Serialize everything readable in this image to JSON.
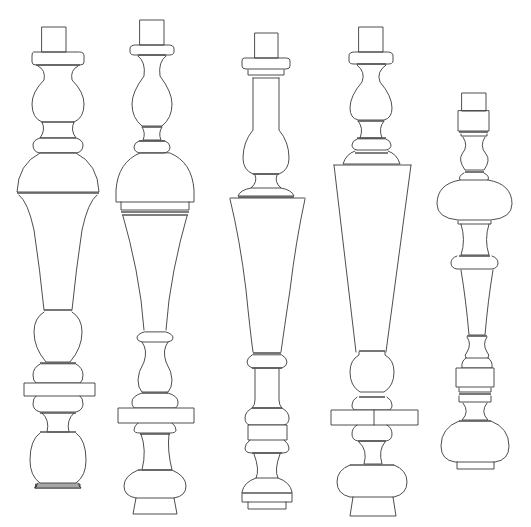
{
  "figure": {
    "description": "Line drawing of five turned baluster designs",
    "background": "#ffffff",
    "line_color": "#3a3a3a"
  },
  "balusters": [
    {
      "id": "baluster-1",
      "cx": 58,
      "shapes": [
        {
          "t": "rect",
          "x": 42,
          "y": 27,
          "w": 24,
          "h": 25
        },
        {
          "t": "path",
          "d": "M33 52 Q32 52 32 56 L32 62 Q32 65 36 65 L80 65 Q84 65 84 62 L84 56 Q84 52 80 52 Z"
        },
        {
          "t": "line",
          "x1": 36,
          "y1": 65,
          "x2": 80,
          "y2": 65,
          "c": "thick"
        },
        {
          "t": "path",
          "d": "M38 66 Q46 70 44 80 Q32 92 32 104 Q32 118 42 122 L74 122 Q84 118 84 104 Q84 92 72 80 Q70 70 78 66"
        },
        {
          "t": "line",
          "x1": 42,
          "y1": 122,
          "x2": 74,
          "y2": 122
        },
        {
          "t": "path",
          "d": "M42 122 Q46 130 40 138 L76 138 Q70 130 74 122"
        },
        {
          "t": "path",
          "d": "M40 138 Q33 140 33 145 Q33 152 40 153 L76 153 Q83 152 83 145 Q83 140 76 138 Z"
        },
        {
          "t": "path",
          "d": "M40 153 Q18 164 17 192 L99 192 Q98 164 76 153 Z"
        },
        {
          "t": "line",
          "x1": 17,
          "y1": 193,
          "x2": 99,
          "y2": 193,
          "c": "thick"
        },
        {
          "t": "path",
          "d": "M19 195 Q28 202 34 230 Q40 270 44 310"
        },
        {
          "t": "path",
          "d": "M97 195 Q88 202 82 230 Q76 270 72 310"
        },
        {
          "t": "line",
          "x1": 44,
          "y1": 310,
          "x2": 72,
          "y2": 310,
          "c": "thick"
        },
        {
          "t": "path",
          "d": "M44 312 Q34 318 34 332 Q34 348 46 362 L70 362 Q82 348 82 332 Q82 318 72 312"
        },
        {
          "t": "path",
          "d": "M40 364 Q33 368 33 375 Q33 381 36 383 L80 383 Q83 381 83 375 Q83 368 76 364 Z"
        },
        {
          "t": "line",
          "x1": 40,
          "y1": 363,
          "x2": 76,
          "y2": 363,
          "c": "thick"
        },
        {
          "t": "rect",
          "x": 24,
          "y": 383,
          "w": 71,
          "h": 13,
          "f": true
        },
        {
          "t": "path",
          "d": "M36 396 Q33 398 33 404 Q33 410 40 412 L76 412 Q83 410 83 404 Q83 398 80 396"
        },
        {
          "t": "line",
          "x1": 40,
          "y1": 413,
          "x2": 76,
          "y2": 413,
          "c": "thick"
        },
        {
          "t": "path",
          "d": "M42 413 Q50 420 47 432 L69 432 Q66 420 74 413"
        },
        {
          "t": "line",
          "x1": 40,
          "y1": 432,
          "x2": 76,
          "y2": 432,
          "c": "thick"
        },
        {
          "t": "path",
          "d": "M40 433 Q30 440 30 460 Q30 476 40 483 L76 483 Q86 476 86 460 Q86 440 76 433"
        },
        {
          "t": "path",
          "d": "M38 483 L35 488 L35 488 L81 488 L78 483"
        },
        {
          "t": "path",
          "d": "M35 488 L35 488 L35 487"
        },
        {
          "t": "path",
          "d": "M36 485 L35 488"
        },
        {
          "t": "rect",
          "x": 36,
          "y": 484,
          "w": 44,
          "h": 2,
          "nf": true
        },
        {
          "t": "path",
          "d": "M37 486 L35 488 L81 488 L79 486"
        }
      ]
    },
    {
      "id": "baluster-2",
      "cx": 153,
      "shapes": [
        {
          "t": "rect",
          "x": 140,
          "y": 20,
          "w": 24,
          "h": 25
        },
        {
          "t": "path",
          "d": "M135 45 Q130 45 130 49 L130 52 Q130 55 135 55 L169 55 Q174 55 174 52 L174 49 Q174 45 169 45 Z"
        },
        {
          "t": "line",
          "x1": 138,
          "y1": 55,
          "x2": 166,
          "y2": 55,
          "c": "thick"
        },
        {
          "t": "path",
          "d": "M138 56 Q146 62 144 76 Q132 92 132 104 Q132 118 142 126 L162 126 Q172 118 172 104 Q172 92 160 76 Q158 62 166 56"
        },
        {
          "t": "path",
          "d": "M142 127 Q146 133 143 140 L161 140 Q158 133 162 127"
        },
        {
          "t": "line",
          "x1": 142,
          "y1": 127,
          "x2": 162,
          "y2": 127,
          "c": "thick"
        },
        {
          "t": "path",
          "d": "M139 141 Q134 143 134 147 Q134 152 140 153 L164 153 Q170 152 170 147 Q170 143 165 141 Z"
        },
        {
          "t": "line",
          "x1": 139,
          "y1": 141,
          "x2": 165,
          "y2": 141,
          "c": "thick"
        },
        {
          "t": "path",
          "d": "M140 153 Q118 162 116 190 Q116 196 116 202 L194 202 Q194 196 194 190 Q192 162 170 153 Z"
        },
        {
          "t": "path",
          "d": "M121 202 L121 210 L189 210 L189 202"
        },
        {
          "t": "line",
          "x1": 121,
          "y1": 212,
          "x2": 189,
          "y2": 212,
          "c": "thick"
        },
        {
          "t": "line",
          "x1": 122,
          "y1": 215,
          "x2": 188,
          "y2": 215,
          "c": "thick"
        },
        {
          "t": "path",
          "d": "M123 216 Q130 240 136 270 Q142 300 144 330"
        },
        {
          "t": "path",
          "d": "M187 216 Q180 240 174 270 Q168 300 166 330"
        },
        {
          "t": "path",
          "d": "M144 332 Q137 334 137 338 Q137 341 142 342 L168 342 Q173 341 173 338 Q173 334 166 332 Z"
        },
        {
          "t": "path",
          "d": "M142 342 Q148 350 144 362 Q138 372 138 380 Q138 388 142 392 L168 392 Q172 388 172 380 Q172 372 166 362 Q162 350 168 342"
        },
        {
          "t": "line",
          "x1": 142,
          "y1": 393,
          "x2": 168,
          "y2": 393,
          "c": "thick"
        },
        {
          "t": "path",
          "d": "M142 393 Q132 396 132 402 Q132 408 136 408 L174 408 Q178 408 178 402 Q178 396 168 393"
        },
        {
          "t": "rect",
          "x": 118,
          "y": 408,
          "w": 76,
          "h": 15,
          "f": true
        },
        {
          "t": "path",
          "d": "M138 423 Q134 426 134 430 Q134 433 140 433 L170 433 Q176 433 176 430 Q176 426 172 423"
        },
        {
          "t": "line",
          "x1": 140,
          "y1": 434,
          "x2": 170,
          "y2": 434,
          "c": "thick"
        },
        {
          "t": "path",
          "d": "M141 434 Q147 450 142 470 L172 470 Q167 450 169 434"
        },
        {
          "t": "line",
          "x1": 138,
          "y1": 470,
          "x2": 172,
          "y2": 470,
          "c": "thick"
        },
        {
          "t": "path",
          "d": "M138 470 Q124 476 124 486 Q124 496 136 498 L174 498 Q186 496 186 486 Q186 476 172 470"
        },
        {
          "t": "path",
          "d": "M136 498 L133 514 L177 514 L174 498"
        }
      ]
    },
    {
      "id": "baluster-3",
      "cx": 266,
      "shapes": [
        {
          "t": "rect",
          "x": 255,
          "y": 33,
          "w": 23,
          "h": 25
        },
        {
          "t": "path",
          "d": "M244 58 Q242 58 242 61 L242 66 Q242 69 246 69 L286 69 Q290 69 290 66 L290 61 Q290 58 287 58 Z"
        },
        {
          "t": "path",
          "d": "M248 70 L248 75 L284 75 L284 70"
        },
        {
          "t": "line",
          "x1": 253,
          "y1": 78,
          "x2": 279,
          "y2": 78
        },
        {
          "t": "path",
          "d": "M253 78 L253 130 Q243 142 243 158 Q243 170 253 174 L279 174 Q289 170 289 158 Q289 142 279 130 L279 78"
        },
        {
          "t": "line",
          "x1": 253,
          "y1": 174,
          "x2": 279,
          "y2": 174,
          "c": "thick"
        },
        {
          "t": "path",
          "d": "M255 175 Q258 182 251 188 L281 188 Q274 182 277 175"
        },
        {
          "t": "path",
          "d": "M251 188 Q240 190 238 196 L294 196 Q292 190 281 188"
        },
        {
          "t": "line",
          "x1": 238,
          "y1": 197,
          "x2": 294,
          "y2": 197,
          "c": "thick"
        },
        {
          "t": "path",
          "d": "M230 198 L305 198"
        },
        {
          "t": "path",
          "d": "M230 199 Q240 240 246 290 Q250 330 253 352"
        },
        {
          "t": "path",
          "d": "M305 199 Q296 240 290 290 Q284 330 281 352"
        },
        {
          "t": "line",
          "x1": 253,
          "y1": 353,
          "x2": 281,
          "y2": 353,
          "c": "thick"
        },
        {
          "t": "path",
          "d": "M252 355 Q247 358 247 362 Q247 366 252 368 L282 368 Q287 366 287 362 Q287 358 282 355 Z"
        },
        {
          "t": "line",
          "x1": 252,
          "y1": 368,
          "x2": 282,
          "y2": 368,
          "c": "thick"
        },
        {
          "t": "path",
          "d": "M255 369 L255 400 Q255 405 252 408 L282 408 Q279 405 279 400 L279 369"
        },
        {
          "t": "path",
          "d": "M252 408 Q245 412 245 418 Q245 424 250 425 L284 425 Q289 424 289 418 Q289 412 282 408"
        },
        {
          "t": "line",
          "x1": 252,
          "y1": 408,
          "x2": 282,
          "y2": 408,
          "c": "thick"
        },
        {
          "t": "rect",
          "x": 248,
          "y": 425,
          "w": 39,
          "h": 15,
          "f": true
        },
        {
          "t": "path",
          "d": "M250 440 Q245 444 245 448 Q245 453 252 453 L282 453 Q289 453 289 448 Q289 444 284 440"
        },
        {
          "t": "line",
          "x1": 252,
          "y1": 453,
          "x2": 282,
          "y2": 453,
          "c": "thick"
        },
        {
          "t": "path",
          "d": "M254 454 Q260 470 256 478 L278 478 Q274 470 280 454"
        },
        {
          "t": "path",
          "d": "M256 478 Q244 482 242 492 L242 502 L292 502 L292 492 Q290 482 278 478"
        },
        {
          "t": "line",
          "x1": 242,
          "y1": 493,
          "x2": 292,
          "y2": 493,
          "c": "thick"
        },
        {
          "t": "path",
          "d": "M248 502 L248 509 L286 509 L286 502"
        }
      ]
    },
    {
      "id": "baluster-4",
      "cx": 373,
      "shapes": [
        {
          "t": "rect",
          "x": 359,
          "y": 27,
          "w": 24,
          "h": 25
        },
        {
          "t": "path",
          "d": "M354 52 Q349 52 349 56 L349 61 Q349 64 354 64 L388 64 Q393 64 393 61 L393 56 Q393 52 388 52 Z"
        },
        {
          "t": "line",
          "x1": 357,
          "y1": 64,
          "x2": 386,
          "y2": 64,
          "c": "thick"
        },
        {
          "t": "path",
          "d": "M357 65 Q366 72 362 82 Q350 96 350 108 Q350 118 358 120 L384 120 Q392 118 392 108 Q392 96 380 82 Q376 72 386 65"
        },
        {
          "t": "path",
          "d": "M358 121 Q364 128 360 138 L382 138 Q378 128 384 121"
        },
        {
          "t": "line",
          "x1": 358,
          "y1": 121,
          "x2": 384,
          "y2": 121,
          "c": "thick"
        },
        {
          "t": "path",
          "d": "M357 139 Q352 141 352 145 Q352 149 357 150 L386 150 Q391 149 391 145 Q391 141 386 139 Z"
        },
        {
          "t": "line",
          "x1": 357,
          "y1": 138,
          "x2": 386,
          "y2": 138,
          "c": "thick"
        },
        {
          "t": "line",
          "x1": 355,
          "y1": 153,
          "x2": 388,
          "y2": 153,
          "c": "thick"
        },
        {
          "t": "path",
          "d": "M355 151 Q346 154 343 164 L400 164 Q397 154 388 151"
        },
        {
          "t": "path",
          "d": "M334 165 L411 165"
        },
        {
          "t": "path",
          "d": "M334 165 L356 352"
        },
        {
          "t": "path",
          "d": "M411 165 L386 352"
        },
        {
          "t": "line",
          "x1": 359,
          "y1": 351,
          "x2": 385,
          "y2": 351,
          "c": "thick"
        },
        {
          "t": "path",
          "d": "M359 352 L359 355 Q350 360 350 372 Q350 386 360 392 L384 392 Q394 386 394 372 Q394 360 385 355 L385 352"
        },
        {
          "t": "line",
          "x1": 359,
          "y1": 397,
          "x2": 385,
          "y2": 397,
          "c": "thick"
        },
        {
          "t": "path",
          "d": "M357 397 Q352 400 352 405 Q352 410 356 410 L388 410 Q392 410 392 405 Q392 400 387 397"
        },
        {
          "t": "rect",
          "x": 331,
          "y": 410,
          "w": 87,
          "h": 15,
          "f": true
        },
        {
          "t": "line",
          "x1": 374,
          "y1": 410,
          "x2": 374,
          "y2": 425
        },
        {
          "t": "path",
          "d": "M357 425 Q352 428 352 434 Q352 440 358 441 L386 441 Q392 440 392 434 Q392 428 387 425"
        },
        {
          "t": "line",
          "x1": 358,
          "y1": 441,
          "x2": 386,
          "y2": 441,
          "c": "thick"
        },
        {
          "t": "path",
          "d": "M359 442 Q368 450 364 464 L382 464 Q378 450 385 442"
        },
        {
          "t": "line",
          "x1": 350,
          "y1": 465,
          "x2": 394,
          "y2": 465,
          "c": "thick"
        },
        {
          "t": "path",
          "d": "M350 465 Q337 470 337 482 Q337 494 350 497 L394 497 Q407 494 407 482 Q407 470 394 465"
        },
        {
          "t": "path",
          "d": "M353 497 L350 516 L396 516 L393 497"
        }
      ]
    },
    {
      "id": "baluster-5",
      "cx": 482,
      "shapes": [
        {
          "t": "rect",
          "x": 462,
          "y": 93,
          "w": 24,
          "h": 18
        },
        {
          "t": "path",
          "d": "M458 111 L458 131 L489 131 L489 111 Z"
        },
        {
          "t": "line",
          "x1": 459,
          "y1": 132,
          "x2": 488,
          "y2": 132,
          "c": "thick"
        },
        {
          "t": "path",
          "d": "M461 134 L461 136 L487 136 L487 134"
        },
        {
          "t": "path",
          "d": "M463 137 Q469 146 462 154 Q458 160 465 170 L484 170 Q491 160 486 154 Q479 146 485 137"
        },
        {
          "t": "line",
          "x1": 465,
          "y1": 172,
          "x2": 484,
          "y2": 172,
          "c": "thick"
        },
        {
          "t": "path",
          "d": "M464 173 Q458 176 460 180 L488 180 Q490 176 484 173"
        },
        {
          "t": "path",
          "d": "M460 180 Q437 184 437 204 Q437 218 458 220 L491 220 Q512 218 512 204 Q512 184 488 180"
        },
        {
          "t": "path",
          "d": "M458 221 L458 224 L491 224 L491 221"
        },
        {
          "t": "path",
          "d": "M461 224 Q466 240 461 255 L489 255 Q484 240 489 224"
        },
        {
          "t": "line",
          "x1": 459,
          "y1": 256,
          "x2": 490,
          "y2": 256,
          "c": "thick"
        },
        {
          "t": "path",
          "d": "M457 256 Q451 258 451 263 Q451 268 457 269 L492 269 Q498 268 498 263 Q498 258 492 256"
        },
        {
          "t": "path",
          "d": "M461 270 Q466 300 469 335 L485 335 Q488 300 493 270"
        },
        {
          "t": "line",
          "x1": 467,
          "y1": 336,
          "x2": 487,
          "y2": 336,
          "c": "thick"
        },
        {
          "t": "path",
          "d": "M467 337 Q472 344 467 352 Q464 355 466 358 L488 358 Q490 355 487 352 Q482 344 487 337"
        },
        {
          "t": "path",
          "d": "M466 358 Q461 361 462 368 L492 368 Q493 361 488 358"
        },
        {
          "t": "rect",
          "x": 456,
          "y": 368,
          "w": 38,
          "h": 19,
          "f": true
        },
        {
          "t": "path",
          "d": "M459 388 L459 392 L491 392 L491 388"
        },
        {
          "t": "line",
          "x1": 459,
          "y1": 394,
          "x2": 491,
          "y2": 394,
          "c": "thick"
        },
        {
          "t": "path",
          "d": "M459 396 L459 402 L491 402 L491 396"
        },
        {
          "t": "path",
          "d": "M463 403 Q470 412 462 420 L488 420 Q480 412 487 403"
        },
        {
          "t": "line",
          "x1": 459,
          "y1": 421,
          "x2": 491,
          "y2": 421,
          "c": "thick"
        },
        {
          "t": "path",
          "d": "M459 421 Q441 428 441 446 Q441 460 455 462 L495 462 Q509 460 509 446 Q509 428 491 421"
        },
        {
          "t": "path",
          "d": "M457 462 L457 469 L494 469 L494 462"
        }
      ]
    }
  ]
}
